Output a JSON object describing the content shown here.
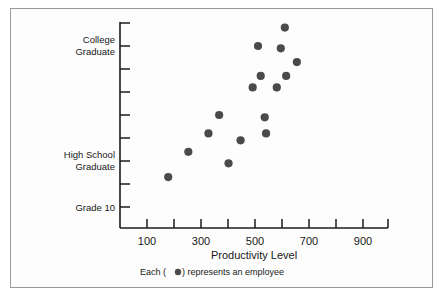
{
  "figure": {
    "border_color": "#9a9a9a",
    "background": "#fdfdfd"
  },
  "chart_data": {
    "type": "scatter",
    "title": "",
    "xlabel": "Productivity Level",
    "ylabel": "",
    "xlim": [
      50,
      1050
    ],
    "ylim": [
      0,
      10
    ],
    "grid": false,
    "legend_position": "below-axis",
    "legend_note": "Each ( ●) represents an employee",
    "marker_color": "#4a4a4a",
    "marker_shape": "circle",
    "x_ticks": [
      100,
      200,
      300,
      400,
      500,
      600,
      700,
      800,
      900,
      1000
    ],
    "x_tick_labels": [
      "100",
      "",
      "300",
      "",
      "500",
      "",
      "700",
      "",
      "900",
      ""
    ],
    "y_ticks": [
      1,
      2,
      3,
      4,
      5,
      6,
      7,
      8,
      9
    ],
    "y_tick_labels": [
      "Grade 10",
      "",
      "High School Graduate",
      "",
      "",
      "",
      "",
      "College Graduate",
      ""
    ],
    "y_category_labels": [
      {
        "value": 1,
        "label_line1": "Grade 10",
        "label_line2": ""
      },
      {
        "value": 3,
        "label_line1": "High School",
        "label_line2": "Graduate"
      },
      {
        "value": 8,
        "label_line1": "College",
        "label_line2": "Graduate"
      }
    ],
    "points": [
      {
        "x": 230,
        "y": 2.3
      },
      {
        "x": 305,
        "y": 3.4
      },
      {
        "x": 380,
        "y": 4.2
      },
      {
        "x": 420,
        "y": 5.0
      },
      {
        "x": 455,
        "y": 2.9
      },
      {
        "x": 500,
        "y": 3.9
      },
      {
        "x": 545,
        "y": 6.2
      },
      {
        "x": 565,
        "y": 8.0
      },
      {
        "x": 575,
        "y": 6.7
      },
      {
        "x": 590,
        "y": 4.9
      },
      {
        "x": 595,
        "y": 4.2
      },
      {
        "x": 635,
        "y": 6.2
      },
      {
        "x": 650,
        "y": 7.9
      },
      {
        "x": 665,
        "y": 8.8
      },
      {
        "x": 670,
        "y": 6.7
      },
      {
        "x": 710,
        "y": 7.3
      }
    ],
    "series_name": "employees",
    "point_count": 16
  },
  "axis_text": {
    "x_title": "Productivity Level",
    "legend_prefix": "Each (",
    "legend_suffix": ") represents an employee"
  }
}
